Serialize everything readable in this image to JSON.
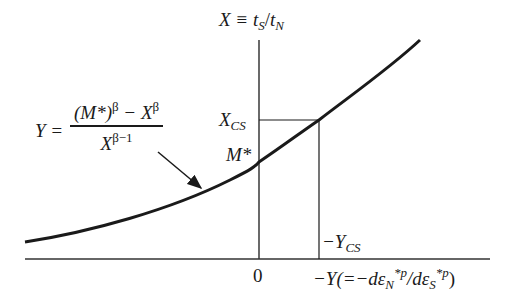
{
  "diagram": {
    "y_axis_label": {
      "prefix": "X ≡ ",
      "t1": "t",
      "t1_sub": "S",
      "slash": "/",
      "t2": "t",
      "t2_sub": "N"
    },
    "x_axis_label": {
      "prefix": "−Y(=−dε",
      "sub1": "N",
      "sup1": "*p",
      "mid": "/dε",
      "sub2": "S",
      "sup2": "*p",
      "suffix": ")"
    },
    "origin_label": "0",
    "x_cs_label": {
      "base": "X",
      "sub": "CS"
    },
    "m_star_label": "M*",
    "neg_y_cs_label": {
      "base": "−Y",
      "sub": "CS"
    },
    "equation": {
      "lhs": "Y =",
      "numerator": {
        "a": "(M*)",
        "a_sup": "β",
        "minus": " − X",
        "b_sup": "β"
      },
      "denominator": {
        "base": "X",
        "sup": "β−1"
      }
    },
    "colors": {
      "line": "#1a1a1a",
      "background": "#ffffff"
    }
  }
}
